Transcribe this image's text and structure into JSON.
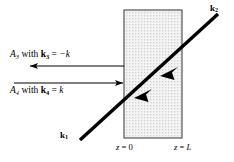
{
  "figure": {
    "caption_present": false,
    "background_color": "#ffffff",
    "width": 234,
    "height": 162
  },
  "slab": {
    "name": "dielectric-slab",
    "fill_pattern": "stipple-dots",
    "fill_color": "#f2f2f2",
    "dot_color": "#9a9a9a",
    "border_color": "#555555",
    "left_px": 124,
    "right_px": 182,
    "top_px": 10,
    "bottom_px": 138
  },
  "beam": {
    "name": "incident-transmitted-beam",
    "color": "#000000",
    "start": {
      "x": 80,
      "y": 140
    },
    "end": {
      "x": 218,
      "y": 14
    },
    "arrowheads": 2,
    "arrow_direction": "down-left"
  },
  "labels": {
    "k1": {
      "main": "k",
      "sub": "1"
    },
    "k2": {
      "main": "k",
      "sub": "2"
    },
    "a3": {
      "amplitude": "A",
      "amplitude_sub": "3",
      "connector": " with ",
      "vector": "k",
      "vector_sub": "3",
      "equals": " = ",
      "value": "−k"
    },
    "a4": {
      "amplitude": "A",
      "amplitude_sub": "4",
      "connector": " with ",
      "vector": "k",
      "vector_sub": "4",
      "equals": " = ",
      "value": "k"
    },
    "z0": {
      "var": "z",
      "eq": " = ",
      "value": "0"
    },
    "zL": {
      "var": "z",
      "eq": " = ",
      "value": "L"
    }
  },
  "arrows": {
    "outgoing_left": {
      "name": "arrow-a3-leftward",
      "direction": "left",
      "y_px": 66,
      "x_start": 124,
      "x_end": 28,
      "color": "#000000"
    },
    "incoming_right": {
      "name": "arrow-a4-rightward",
      "direction": "right",
      "y_px": 83,
      "x_start": 14,
      "x_end": 124,
      "color": "#000000"
    }
  },
  "colors": {
    "ink": "#000000",
    "slab_border": "#555555",
    "slab_fill": "#f2f2f2"
  }
}
